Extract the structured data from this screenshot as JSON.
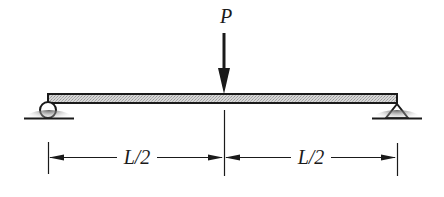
{
  "diagram": {
    "load": {
      "label": "P",
      "position": "midspan",
      "direction": "down"
    },
    "supports": [
      {
        "type": "roller",
        "position": "left end"
      },
      {
        "type": "pin",
        "position": "right end"
      }
    ],
    "dimensions": [
      {
        "label": "L/2",
        "span": "left support to load"
      },
      {
        "label": "L/2",
        "span": "load to right support"
      }
    ],
    "colors": {
      "line": "#1a1a1a",
      "beam_fill": "#c8c8c8",
      "ground_shade": "#8a8a8a"
    }
  }
}
